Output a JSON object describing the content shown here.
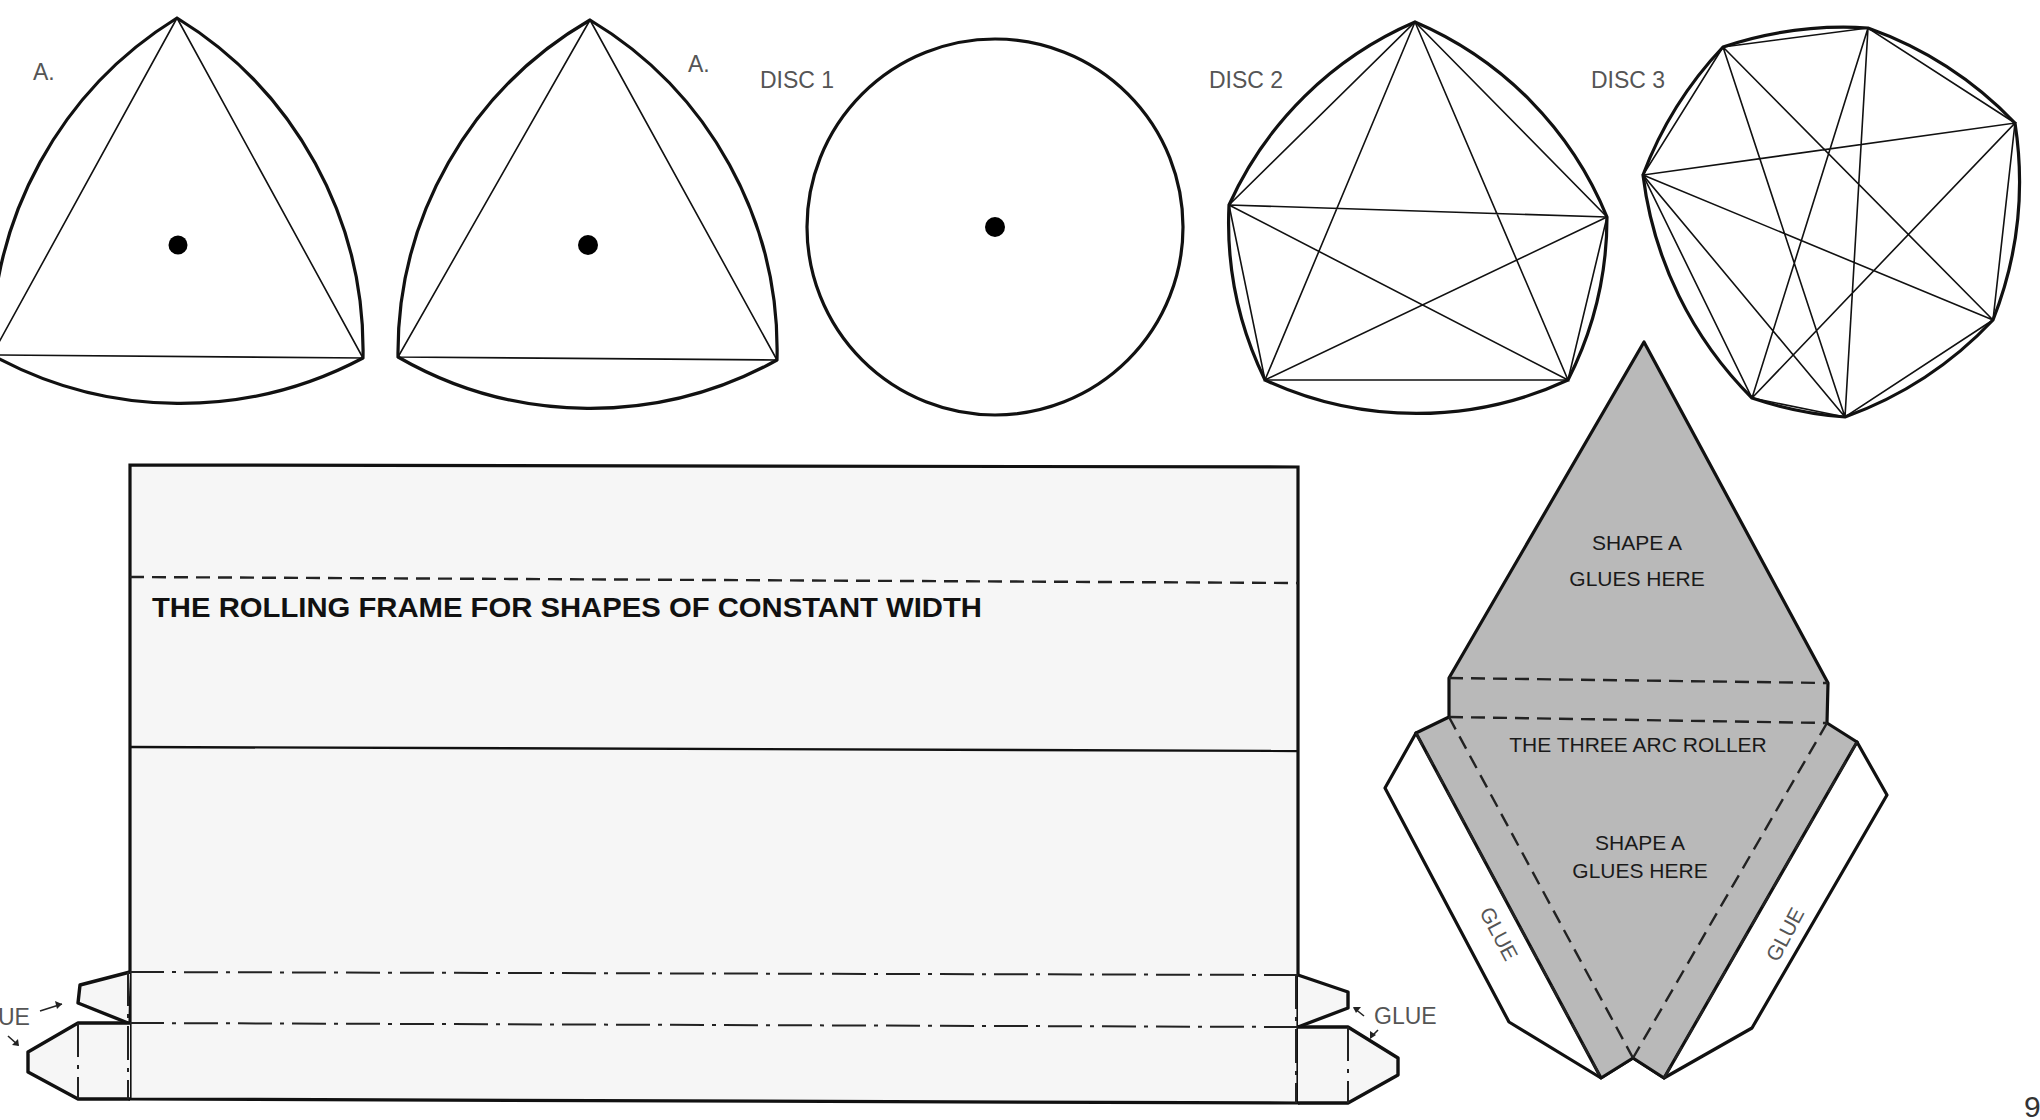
{
  "page": {
    "page_number": "9",
    "colors": {
      "background": "#ffffff",
      "light_shape_fill": "#b9b9b9",
      "dark_shape_fill": "#8f8f8f",
      "white_shape_fill": "#f5f5f5",
      "frame_fill": "#f6f6f6",
      "ink": "#111111",
      "label_gray": "#555555"
    }
  },
  "shapes": {
    "reuleaux_a1": {
      "label": "A.",
      "label_pos": [
        33,
        80
      ],
      "vertices": [
        [
          177,
          18
        ],
        [
          363,
          358
        ],
        [
          -8,
          355
        ]
      ],
      "center_dot": [
        178,
        245
      ],
      "fill": "#b9b9b9"
    },
    "reuleaux_a2": {
      "label": "A.",
      "label_pos": [
        688,
        72
      ],
      "vertices": [
        [
          590,
          20
        ],
        [
          777,
          360
        ],
        [
          398,
          357
        ]
      ],
      "center_dot": [
        588,
        245
      ],
      "fill": "#b9b9b9"
    },
    "disc1": {
      "label": "DISC 1",
      "label_pos": [
        760,
        88
      ],
      "center": [
        995,
        227
      ],
      "radius": 188,
      "center_dot": [
        995,
        227
      ],
      "fill": "#8f8f8f"
    },
    "disc2": {
      "label": "DISC 2",
      "label_pos": [
        1209,
        88
      ],
      "vertices": [
        [
          1415,
          22
        ],
        [
          1607,
          217
        ],
        [
          1568,
          380
        ],
        [
          1265,
          380
        ],
        [
          1229,
          205
        ]
      ],
      "fill": "#f5f5f5"
    },
    "disc3": {
      "label": "DISC 3",
      "label_pos": [
        1591,
        88
      ],
      "vertices": [
        [
          1868,
          28
        ],
        [
          2015,
          123
        ],
        [
          1993,
          320
        ],
        [
          1845,
          417
        ],
        [
          1752,
          398
        ],
        [
          1643,
          175
        ],
        [
          1723,
          47
        ]
      ],
      "fill": "#8f8f8f"
    }
  },
  "frame": {
    "title": "THE ROLLING FRAME FOR SHAPES OF CONSTANT WIDTH",
    "title_pos": [
      152,
      617
    ],
    "left": 130,
    "right": 1298,
    "top": 465,
    "dashed_fold_y": [
      581,
      583
    ],
    "solid_line_y": [
      747,
      751
    ],
    "dashdot_y1": [
      972,
      975
    ],
    "dashdot_y2": [
      1023,
      1027
    ],
    "bottom": [
      1099,
      1103
    ],
    "glue_label_left": "UE",
    "glue_label_left_pos": [
      0,
      1025
    ],
    "glue_label_right": "GLUE",
    "glue_label_right_pos": [
      1374,
      1025
    ]
  },
  "roller_net": {
    "title": "THE THREE ARC ROLLER",
    "title_pos": [
      1638,
      752
    ],
    "upper_label_line1": "SHAPE A",
    "upper_label_line2": "GLUES HERE",
    "upper_label_pos": [
      1637,
      550
    ],
    "lower_label_line1": "SHAPE A",
    "lower_label_line2": "GLUES HERE",
    "lower_label_pos": [
      1638,
      850
    ],
    "glue_tab_left_label": "GLUE",
    "glue_tab_right_label": "GLUE",
    "fill": "#b9b9b9"
  }
}
